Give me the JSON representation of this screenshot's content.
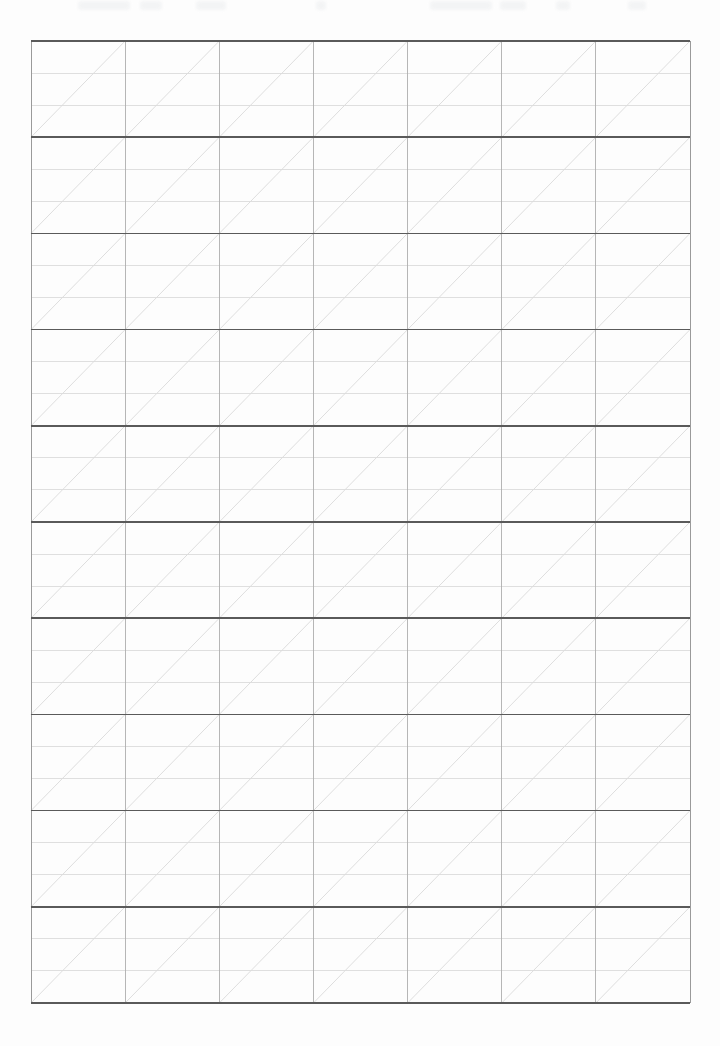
{
  "document": {
    "kind": "practice-grid-sheet",
    "title": "Blank Ruled Practice Grid",
    "page_width": 720,
    "page_height": 1046,
    "background_color": "#fdfdfd",
    "has_text_content": false,
    "notes": "Blank handwriting / calligraphy practice sheet. No printed text, labels, numbers or marks other than the ruling itself."
  },
  "grid": {
    "left": 31,
    "top": 41,
    "right": 690,
    "bottom": 1003,
    "width": 659,
    "height": 962,
    "columns": 7,
    "blocks": 10,
    "subrows_per_block": 3,
    "column_width": 94.14,
    "block_height": 96.2,
    "subrow_height": 32.07,
    "total_cells": 70,
    "diagonal": {
      "present": true,
      "direction": "bottom-left-to-top-right",
      "per": "cell",
      "count": 70
    }
  },
  "strokes": {
    "block_rule": {
      "name": "block-divider",
      "color": "#5a5a5a",
      "width": 1.6,
      "count": 11,
      "orientation": "horizontal"
    },
    "subrow_rule": {
      "name": "subrow-divider",
      "color": "#dcdcdc",
      "width": 0.9,
      "count": 20,
      "orientation": "horizontal"
    },
    "column_rule": {
      "name": "column-divider",
      "color": "#aeaeae",
      "width": 0.9,
      "count": 6,
      "orientation": "vertical"
    },
    "edge_rule": {
      "name": "grid-outer-edge",
      "color": "#9a9a9a",
      "width": 1.0,
      "orientation": "vertical"
    },
    "diagonal_rule": {
      "name": "diagonal-guide",
      "color": "#d5d5d5",
      "width": 0.8
    }
  },
  "ghosting": {
    "present": true,
    "description": "very faint light-gray scanner ghosting along the top margin; no legible characters",
    "color": "#f2f3f4",
    "smudges": [
      {
        "x": 78,
        "width": 52
      },
      {
        "x": 140,
        "width": 22
      },
      {
        "x": 196,
        "width": 30
      },
      {
        "x": 316,
        "width": 10
      },
      {
        "x": 430,
        "width": 62
      },
      {
        "x": 500,
        "width": 26
      },
      {
        "x": 556,
        "width": 14
      },
      {
        "x": 628,
        "width": 18
      }
    ]
  }
}
